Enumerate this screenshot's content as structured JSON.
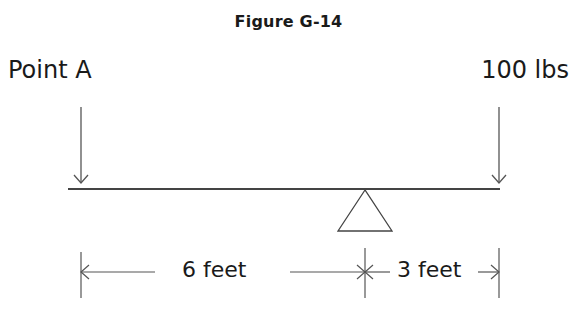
{
  "figure": {
    "title": "Figure G-14"
  },
  "labels": {
    "left_force": "Point A",
    "right_force": "100 lbs"
  },
  "dimensions": {
    "left_span": "6 feet",
    "right_span": "3 feet"
  },
  "elements": {
    "beam": "lever-beam",
    "fulcrum": "triangle-fulcrum",
    "arrows": [
      "down-arrow-point-a",
      "down-arrow-100-lbs"
    ]
  }
}
